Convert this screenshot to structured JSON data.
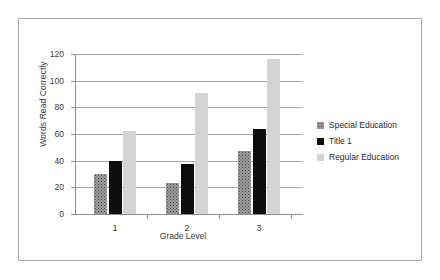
{
  "chart_data": {
    "type": "bar",
    "title": "",
    "xlabel": "Grade Level",
    "ylabel": "Words Read Correctly",
    "categories": [
      "1",
      "2",
      "3"
    ],
    "ylim": [
      0,
      120
    ],
    "yticks": [
      "0",
      "20",
      "40",
      "60",
      "80",
      "100",
      "120"
    ],
    "ytick_values": [
      0,
      20,
      40,
      60,
      80,
      100,
      120
    ],
    "grid": true,
    "legend_position": "right",
    "series": [
      {
        "name": "Special Education",
        "color": "#9d9d9d",
        "pattern": "speckled",
        "values": [
          30,
          23,
          47.5
        ]
      },
      {
        "name": "Title 1",
        "color": "#0d0d0d",
        "pattern": "solid",
        "values": [
          40,
          37.5,
          63.5
        ]
      },
      {
        "name": "Regular Education",
        "color": "#d4d4d4",
        "pattern": "solid",
        "values": [
          62,
          91,
          116
        ]
      }
    ]
  },
  "legend": {
    "items": [
      {
        "label": "Special Education"
      },
      {
        "label": "Title 1"
      },
      {
        "label": "Regular Education"
      }
    ]
  }
}
